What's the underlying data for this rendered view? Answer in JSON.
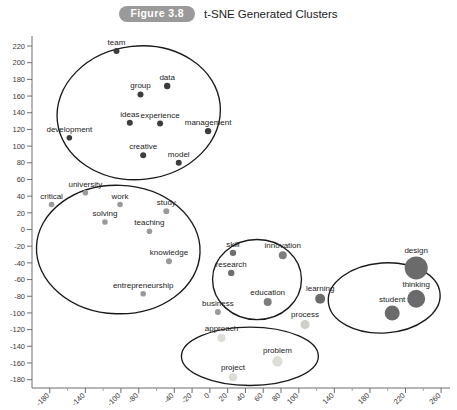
{
  "header": {
    "badge": "Figure 3.8",
    "title": "t-SNE Generated Clusters"
  },
  "chart_data": {
    "type": "scatter",
    "title": "t-SNE Generated Clusters",
    "xlabel": "",
    "ylabel": "",
    "xlim": [
      -200,
      270
    ],
    "ylim": [
      -190,
      232
    ],
    "grid": false,
    "legend": null,
    "xticks": [
      -180,
      -140,
      -100,
      -80,
      -40,
      -20,
      0,
      20,
      40,
      60,
      80,
      100,
      140,
      180,
      220,
      260
    ],
    "yticks": [
      220,
      200,
      180,
      160,
      140,
      120,
      100,
      80,
      60,
      40,
      20,
      0,
      -20,
      -40,
      -60,
      -80,
      -100,
      -120,
      -140,
      -160,
      -180
    ],
    "marker_colors": {
      "small": "#3a3a3a",
      "medium": "#8d8d8d",
      "large": "#6b6b6b",
      "pale": "#d8d8d4"
    },
    "points": [
      {
        "label": "team",
        "x": -105,
        "y": 214,
        "size": 3.0,
        "shade": "#3d3d3d"
      },
      {
        "label": "data",
        "x": -48,
        "y": 172,
        "size": 3.2,
        "shade": "#3d3d3d"
      },
      {
        "label": "group",
        "x": -78,
        "y": 162,
        "size": 3.0,
        "shade": "#3d3d3d"
      },
      {
        "label": "ideas",
        "x": -90,
        "y": 128,
        "size": 3.0,
        "shade": "#3d3d3d"
      },
      {
        "label": "experience",
        "x": -56,
        "y": 127,
        "size": 3.0,
        "shade": "#3d3d3d"
      },
      {
        "label": "management",
        "x": -2,
        "y": 118,
        "size": 3.2,
        "shade": "#3d3d3d"
      },
      {
        "label": "development",
        "x": -158,
        "y": 110,
        "size": 2.8,
        "shade": "#3d3d3d"
      },
      {
        "label": "creative",
        "x": -75,
        "y": 89,
        "size": 3.0,
        "shade": "#3d3d3d"
      },
      {
        "label": "model",
        "x": -35,
        "y": 80,
        "size": 3.0,
        "shade": "#3d3d3d"
      },
      {
        "label": "university",
        "x": -140,
        "y": 44,
        "size": 2.8,
        "shade": "#9a9a9a"
      },
      {
        "label": "critical",
        "x": -178,
        "y": 30,
        "size": 2.8,
        "shade": "#9a9a9a"
      },
      {
        "label": "work",
        "x": -101,
        "y": 30,
        "size": 2.8,
        "shade": "#9a9a9a"
      },
      {
        "label": "study",
        "x": -49,
        "y": 22,
        "size": 3.0,
        "shade": "#9a9a9a"
      },
      {
        "label": "solving",
        "x": -118,
        "y": 9,
        "size": 2.8,
        "shade": "#9a9a9a"
      },
      {
        "label": "teaching",
        "x": -68,
        "y": -2,
        "size": 2.8,
        "shade": "#9a9a9a"
      },
      {
        "label": "knowledge",
        "x": -46,
        "y": -38,
        "size": 3.0,
        "shade": "#9a9a9a"
      },
      {
        "label": "entrepreneurship",
        "x": -75,
        "y": -77,
        "size": 2.8,
        "shade": "#9a9a9a"
      },
      {
        "label": "skill",
        "x": 26,
        "y": -28,
        "size": 3.2,
        "shade": "#6f6f6f"
      },
      {
        "label": "innovation",
        "x": 82,
        "y": -31,
        "size": 4.0,
        "shade": "#7d7d7d"
      },
      {
        "label": "research",
        "x": 24,
        "y": -52,
        "size": 3.2,
        "shade": "#6f6f6f"
      },
      {
        "label": "education",
        "x": 65,
        "y": -87,
        "size": 4.0,
        "shade": "#7d7d7d"
      },
      {
        "label": "business",
        "x": 9,
        "y": -99,
        "size": 3.0,
        "shade": "#9a9a9a"
      },
      {
        "label": "process",
        "x": 107,
        "y": -114,
        "size": 4.6,
        "shade": "#cfcfc9"
      },
      {
        "label": "learning",
        "x": 124,
        "y": -83,
        "size": 5.0,
        "shade": "#6b6b6b"
      },
      {
        "label": "design",
        "x": 232,
        "y": -46,
        "size": 11.5,
        "shade": "#6b6b6b"
      },
      {
        "label": "thinking",
        "x": 232,
        "y": -83,
        "size": 9.0,
        "shade": "#6b6b6b"
      },
      {
        "label": "student",
        "x": 205,
        "y": -100,
        "size": 7.5,
        "shade": "#6b6b6b"
      },
      {
        "label": "approach",
        "x": 13,
        "y": -130,
        "size": 4.0,
        "shade": "#ddddd8"
      },
      {
        "label": "problem",
        "x": 76,
        "y": -158,
        "size": 5.2,
        "shade": "#ddddd8"
      },
      {
        "label": "project",
        "x": 26,
        "y": -177,
        "size": 4.2,
        "shade": "#ddddd8"
      }
    ],
    "clusters": [
      {
        "name": "leadership-cluster",
        "cx": -80,
        "cy": 140,
        "rx": 92,
        "ry": 80,
        "rot": -6
      },
      {
        "name": "learning-cluster",
        "cx": -103,
        "cy": -24,
        "rx": 92,
        "ry": 77,
        "rot": 2
      },
      {
        "name": "innovation-cluster",
        "cx": 53,
        "cy": -60,
        "rx": 50,
        "ry": 48,
        "rot": 0
      },
      {
        "name": "design-thinking-cluster",
        "cx": 196,
        "cy": -82,
        "rx": 63,
        "ry": 42,
        "rot": -4
      },
      {
        "name": "problem-solving-cluster",
        "cx": 45,
        "cy": -152,
        "rx": 77,
        "ry": 35,
        "rot": 0
      }
    ]
  }
}
